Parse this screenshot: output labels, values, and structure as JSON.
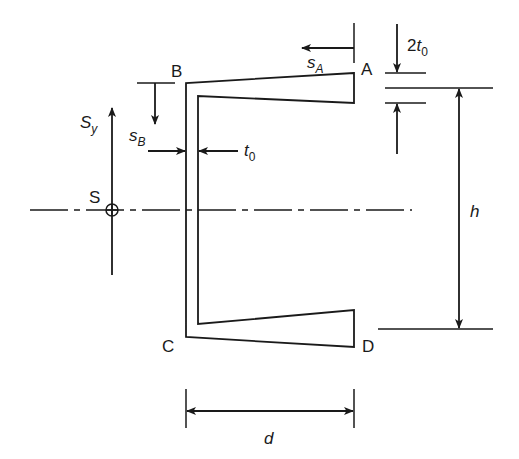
{
  "figure": {
    "type": "channel-section-shear-centre",
    "colors": {
      "stroke": "#1a1a1a",
      "background": "#ffffff"
    }
  },
  "labels": {
    "point_a": "A",
    "point_b": "B",
    "point_c": "C",
    "point_d": "D",
    "shear_centre": "S",
    "shear_force": {
      "base": "S",
      "sub": "y"
    },
    "coord_sa": {
      "base": "s",
      "sub": "A"
    },
    "coord_sb": {
      "base": "s",
      "sub": "B"
    },
    "web_thickness": {
      "base": "t",
      "sub": "0"
    },
    "flange_root_thickness": {
      "prefix": "2",
      "base": "t",
      "sub": "0"
    },
    "height": "h",
    "depth": "d"
  },
  "geometry": {
    "web_outer_x": 186,
    "web_inner_x": 198,
    "flange_tip_x": 354,
    "top_outer_y": 83,
    "top_tip_outer_y": 73,
    "top_tip_inner_y": 103,
    "top_inner_y": 96,
    "bottom_inner_y": 324,
    "bottom_tip_inner_y": 310,
    "bottom_tip_outer_y": 347,
    "bottom_outer_y": 337,
    "centreline_y": 210,
    "shear_centre": {
      "x": 112,
      "y": 210,
      "r": 6
    }
  }
}
